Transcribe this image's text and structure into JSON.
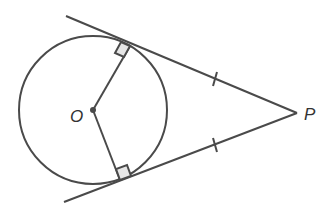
{
  "diagram": {
    "labels": {
      "center": "O",
      "external_point": "P"
    },
    "colors": {
      "stroke": "#4a4a4a",
      "right_angle_fill": "#e6e6e6",
      "text": "#333333"
    },
    "annotations": [
      "right angle at upper tangent point",
      "right angle at lower tangent point",
      "equal tick marks on both tangent segments"
    ]
  }
}
